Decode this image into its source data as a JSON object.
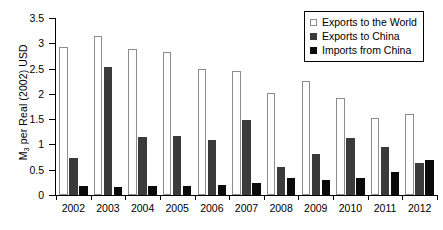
{
  "chart_data": {
    "type": "bar",
    "title": "",
    "subtitle": "",
    "xlabel": "",
    "ylabel": "M3 per Real (2002) USD",
    "ylabel_parts": {
      "pre": "M",
      "sub": "3",
      "post": " per Real (2002) USD"
    },
    "categories": [
      "2002",
      "2003",
      "2004",
      "2005",
      "2006",
      "2007",
      "2008",
      "2009",
      "2010",
      "2011",
      "2012"
    ],
    "series": [
      {
        "name": "Exports to the World",
        "color": "#ffffff",
        "edge_color": "#8c8c8c",
        "values": [
          2.93,
          3.15,
          2.88,
          2.83,
          2.5,
          2.46,
          2.01,
          2.25,
          1.92,
          1.52,
          1.6
        ]
      },
      {
        "name": "Exports to China",
        "color": "#3a3a3a",
        "edge_color": "#3a3a3a",
        "values": [
          0.74,
          2.54,
          1.14,
          1.17,
          1.09,
          1.49,
          0.55,
          0.82,
          1.13,
          0.95,
          0.64
        ]
      },
      {
        "name": "Imports from China",
        "color": "#0a0a0a",
        "edge_color": "#0a0a0a",
        "values": [
          0.17,
          0.15,
          0.17,
          0.17,
          0.19,
          0.23,
          0.33,
          0.3,
          0.34,
          0.45,
          0.69
        ]
      }
    ],
    "ylim": [
      0,
      3.5
    ],
    "yticks": [
      0,
      0.5,
      1,
      1.5,
      2,
      2.5,
      3,
      3.5
    ],
    "ytick_labels": [
      "0",
      "0.5",
      "1",
      "1.5",
      "2",
      "2.5",
      "3",
      "3.5"
    ],
    "grid": false,
    "legend_position": "top-right"
  },
  "legend": {
    "entries": [
      {
        "label": "Exports to the World"
      },
      {
        "label": "Exports to China"
      },
      {
        "label": "Imports from China"
      }
    ]
  }
}
